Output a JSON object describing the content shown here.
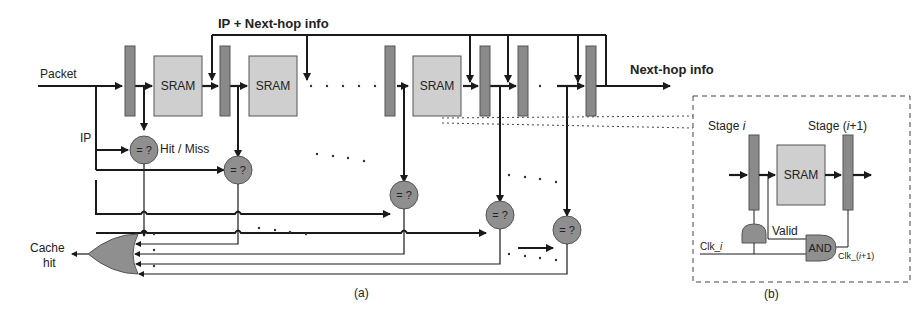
{
  "figure": {
    "top_feedback_label": "IP + Next-hop info",
    "input_label": "Packet",
    "output_label": "Next-hop info",
    "ip_label": "IP",
    "hit_miss_label": "Hit / Miss",
    "cache_hit_label_line1": "Cache",
    "cache_hit_label_line2": "hit",
    "sram_label": "SRAM",
    "comparator_label": "= ?",
    "ellipsis": ". . . .",
    "caption_a": "(a)",
    "caption_b": "(b)"
  },
  "inset": {
    "stage_i_label": "Stage i",
    "stage_i_prefix": "Stage ",
    "stage_i_var": "i",
    "stage_i1_prefix": "Stage (",
    "stage_i1_var": "i",
    "stage_i1_suffix": "+1)",
    "sram_label": "SRAM",
    "valid_label": "Valid",
    "and_label": "AND",
    "clk_i_prefix": "Clk_",
    "clk_i_var": "i",
    "clk_i1_prefix": "Clk_(",
    "clk_i1_var": "i",
    "clk_i1_suffix": "+1)"
  },
  "colors": {
    "register": "#8a8a8a",
    "sram": "#cfcfcf",
    "comparator": "#8f8f8f",
    "gate": "#8f8f8f",
    "line": "#1a1a1a"
  }
}
